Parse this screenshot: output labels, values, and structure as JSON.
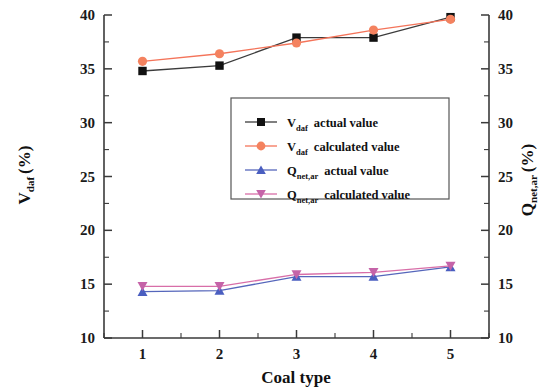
{
  "chart_data": {
    "type": "line",
    "title": "",
    "xlabel": "Coal type",
    "ylabel": "V_daf (%)",
    "y2label": "Q_net,ar (%)",
    "x": [
      1,
      2,
      3,
      4,
      5
    ],
    "xlim": [
      0.5,
      5.5
    ],
    "ylim": [
      10,
      40
    ],
    "y2lim": [
      10,
      40
    ],
    "ytick_labels": [
      "10",
      "15",
      "20",
      "25",
      "30",
      "35",
      "40"
    ],
    "ytick_values": [
      10,
      15,
      20,
      25,
      30,
      35,
      40
    ],
    "y2tick_labels": [
      "10",
      "15",
      "20",
      "25",
      "30",
      "35",
      "40"
    ],
    "xtick_labels": [
      "1",
      "2",
      "3",
      "4",
      "5"
    ],
    "grid": false,
    "minor_ticks": true,
    "legend_position": "center",
    "series": [
      {
        "name": "V_daf  actual  value",
        "axis": "left",
        "marker": "square",
        "color": "#111111",
        "line_color": "#3b3b3b",
        "values": [
          34.8,
          35.3,
          37.9,
          37.9,
          39.8
        ]
      },
      {
        "name": "V_daf  calculated value",
        "axis": "left",
        "marker": "circle",
        "color": "#f4825f",
        "line_color": "#f4745a",
        "values": [
          35.7,
          36.4,
          37.4,
          38.6,
          39.6
        ]
      },
      {
        "name": "Q_net,ar  actual  value",
        "axis": "right",
        "marker": "triangle-up",
        "color": "#4a5ec0",
        "line_color": "#5566bb",
        "values": [
          14.3,
          14.4,
          15.7,
          15.7,
          16.6
        ]
      },
      {
        "name": "Q_net,ar  calculated value",
        "axis": "right",
        "marker": "triangle-down",
        "color": "#c563a8",
        "line_color": "#d86ea8",
        "values": [
          14.8,
          14.8,
          15.9,
          16.1,
          16.7
        ]
      }
    ]
  },
  "axes": {
    "left_title_main": "V",
    "left_title_sub": "daf",
    "left_title_unit": "(%)",
    "right_title_main": "Q",
    "right_title_sub": "net,ar",
    "right_title_unit": "(%)",
    "x_title": "Coal type"
  },
  "legend": {
    "entries": [
      {
        "symbol_name": "square-marker",
        "label_main": "V",
        "label_sub": "daf",
        "label_rest": "actual  value"
      },
      {
        "symbol_name": "circle-marker",
        "label_main": "V",
        "label_sub": "daf",
        "label_rest": "calculated value"
      },
      {
        "symbol_name": "triangle-up-marker",
        "label_main": "Q",
        "label_sub": "net,ar",
        "label_rest": "actual  value"
      },
      {
        "symbol_name": "triangle-down-marker",
        "label_main": "Q",
        "label_sub": "net,ar",
        "label_rest": "calculated value"
      }
    ]
  },
  "colors": {
    "v_actual": "#111111",
    "v_calculated": "#f4825f",
    "q_actual": "#4a5ec0",
    "q_calculated": "#c563a8",
    "axis": "#3a3a3a"
  }
}
